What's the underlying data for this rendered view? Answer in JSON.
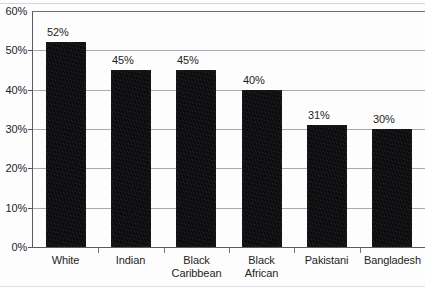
{
  "chart_data": {
    "type": "bar",
    "title": "",
    "subtitle": "",
    "xlabel": "",
    "ylabel": "",
    "categories": [
      "White",
      "Indian",
      "Black Caribbean",
      "Black African",
      "Pakistani",
      "Bangladesh"
    ],
    "category_lines": [
      [
        "White"
      ],
      [
        "Indian"
      ],
      [
        "Black",
        "Caribbean"
      ],
      [
        "Black",
        "African"
      ],
      [
        "Pakistani"
      ],
      [
        "Bangladesh"
      ]
    ],
    "values": [
      52,
      45,
      45,
      40,
      31,
      30
    ],
    "value_labels": [
      "52%",
      "45%",
      "45%",
      "40%",
      "31%",
      "30%"
    ],
    "ylim": [
      0,
      60
    ],
    "ytick_values": [
      0,
      10,
      20,
      30,
      40,
      50,
      60
    ],
    "ytick_labels": [
      "0%",
      "10%",
      "20%",
      "30%",
      "40%",
      "50%",
      "60%"
    ],
    "grid": true,
    "grid_axis": "y",
    "legend": "none",
    "bar_color": "#0b0b0d",
    "grid_color": "#a9a9b0",
    "axis_color": "#5b5b62",
    "text_color": "#1d1d23",
    "background": "#fdfdfd"
  }
}
